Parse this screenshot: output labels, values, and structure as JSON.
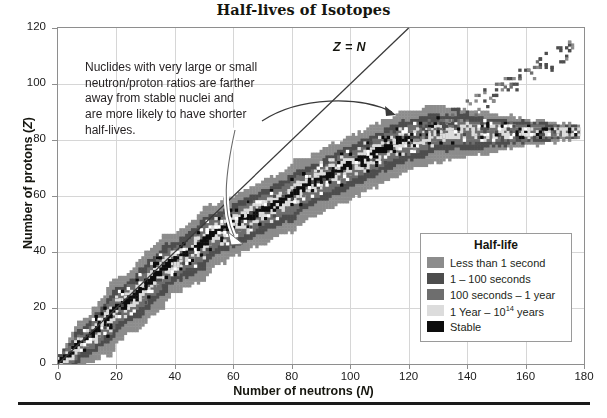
{
  "title": "Half-lives of Isotopes",
  "axes": {
    "x": {
      "label_prefix": "Number of neutrons (",
      "label_symbol": "N",
      "label_suffix": ")",
      "ticks": [
        0,
        20,
        40,
        60,
        80,
        100,
        120,
        140,
        160,
        180
      ],
      "min": 0,
      "max": 180
    },
    "y": {
      "label_prefix": "Number of protons (",
      "label_symbol": "Z",
      "label_suffix": ")",
      "ticks": [
        0,
        20,
        40,
        60,
        80,
        100,
        120
      ],
      "min": 0,
      "max": 120
    }
  },
  "reference_line": {
    "label_z": "Z",
    "label_eq": "=",
    "label_n": "N",
    "equation": "Z = N"
  },
  "annotation": {
    "line1": "Nuclides with very large or small",
    "line2": "neutron/proton ratios are farther",
    "line3": "away from stable nuclei and",
    "line4": "are more likely to have shorter",
    "line5": "half-lives."
  },
  "legend": {
    "title": "Half-life",
    "items": [
      {
        "label": "Less than 1 second",
        "color": "#8c8c8c",
        "key": "lt1s"
      },
      {
        "label": "1 – 100 seconds",
        "color": "#4d4d4d",
        "key": "1to100s"
      },
      {
        "label": "100 seconds – 1 year",
        "color": "#6e6e6e",
        "key": "100s1y"
      },
      {
        "label_pre": "1 Year – 10",
        "label_sup": "14",
        "label_post": " years",
        "label": "1 Year – 10¹⁴ years",
        "color": "#dcdcdc",
        "key": "1y1e14y"
      },
      {
        "label": "Stable",
        "color": "#0d0d0d",
        "key": "stable"
      }
    ]
  },
  "colors": {
    "grid": "#d6d6d6",
    "frame": "#8e8e8e",
    "text": "#231f20",
    "zn_line": "#3a3a3a",
    "arrow_dark": "#3a3a3a",
    "arrow_light": "#ffffff",
    "background": "#ffffff"
  },
  "chart_data": {
    "type": "scatter",
    "title": "Half-lives of Isotopes",
    "xlabel": "Number of neutrons (N)",
    "ylabel": "Number of protons (Z)",
    "xlim": [
      0,
      180
    ],
    "ylim": [
      0,
      120
    ],
    "xticks": [
      0,
      20,
      40,
      60,
      80,
      100,
      120,
      140,
      160,
      180
    ],
    "yticks": [
      0,
      20,
      40,
      60,
      80,
      100,
      120
    ],
    "grid": true,
    "legend_position": "lower-right",
    "legend_title": "Half-life",
    "categories": [
      "Less than 1 second",
      "1 – 100 seconds",
      "100 seconds – 1 year",
      "1 Year – 10^14 years",
      "Stable"
    ],
    "category_colors": [
      "#8c8c8c",
      "#4d4d4d",
      "#6e6e6e",
      "#dcdcdc",
      "#0d0d0d"
    ],
    "annotations": [
      {
        "text": "Z = N",
        "x": 103,
        "y": 112,
        "style": "bold-italic"
      },
      {
        "text": "Nuclides with very large or small neutron/proton ratios are farther away from stable nuclei and are more likely to have shorter half-lives.",
        "x": 12,
        "y": 106
      }
    ],
    "reference_lines": [
      {
        "type": "identity",
        "equation": "Z = N",
        "from": [
          0,
          0
        ],
        "to": [
          120,
          120
        ]
      }
    ],
    "stability_line": {
      "comment": "Valley of stability: (N, Z) control points of the black stable band",
      "points": [
        [
          0,
          1
        ],
        [
          1,
          1
        ],
        [
          2,
          2
        ],
        [
          4,
          3
        ],
        [
          5,
          4
        ],
        [
          6,
          6
        ],
        [
          7,
          7
        ],
        [
          8,
          8
        ],
        [
          10,
          9
        ],
        [
          12,
          11
        ],
        [
          14,
          13
        ],
        [
          16,
          15
        ],
        [
          18,
          17
        ],
        [
          20,
          20
        ],
        [
          22,
          21
        ],
        [
          24,
          23
        ],
        [
          26,
          24
        ],
        [
          28,
          26
        ],
        [
          30,
          28
        ],
        [
          32,
          30
        ],
        [
          34,
          32
        ],
        [
          36,
          34
        ],
        [
          38,
          36
        ],
        [
          42,
          38
        ],
        [
          45,
          40
        ],
        [
          48,
          42
        ],
        [
          50,
          44
        ],
        [
          52,
          46
        ],
        [
          56,
          48
        ],
        [
          60,
          50
        ],
        [
          64,
          52
        ],
        [
          68,
          54
        ],
        [
          72,
          56
        ],
        [
          76,
          58
        ],
        [
          80,
          60
        ],
        [
          82,
          62
        ],
        [
          86,
          64
        ],
        [
          90,
          66
        ],
        [
          94,
          68
        ],
        [
          98,
          70
        ],
        [
          102,
          72
        ],
        [
          106,
          74
        ],
        [
          110,
          76
        ],
        [
          114,
          78
        ],
        [
          118,
          80
        ],
        [
          122,
          81
        ],
        [
          126,
          82
        ],
        [
          126,
          83
        ]
      ]
    },
    "band_widths": {
      "comment": "Approximate perpendicular half-widths (in nucleon units) of each half-life shell, as a function of N",
      "stable": 1.0,
      "1y_1e14y": 2.0,
      "100s_1y": 4.5,
      "1_100s": 7.0,
      "lt_1s": 11.0
    },
    "extent": {
      "max_N": 178,
      "max_Z": 119,
      "n_isotopes_approx": 3000
    }
  }
}
